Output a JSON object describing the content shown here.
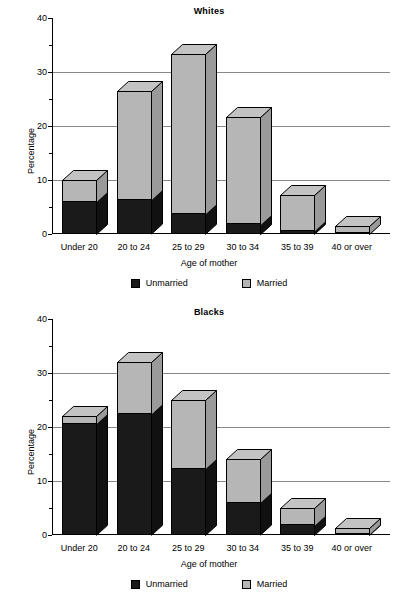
{
  "figure": {
    "axis_y_label": "Percentage",
    "axis_x_label": "Age of mother",
    "legend": {
      "unmarried_label": "Unmarried",
      "married_label": "Married",
      "unmarried_color": "#1a1a1a",
      "married_color": "#b6b6b6"
    }
  },
  "chart_data": [
    {
      "type": "bar",
      "subtype": "stacked-3d-column",
      "title": "Whites",
      "xlabel": "Age of mother",
      "ylabel": "Percentage",
      "categories": [
        "Under 20",
        "20 to 24",
        "25 to 29",
        "30 to 34",
        "35 to 39",
        "40 or over"
      ],
      "series": [
        {
          "name": "Unmarried",
          "color": "#1a1a1a",
          "values": [
            6,
            6.3,
            3.7,
            1.8,
            0.6,
            0.1
          ]
        },
        {
          "name": "Married",
          "color": "#b6b6b6",
          "values": [
            4,
            20.1,
            29.6,
            19.9,
            6.6,
            1.4
          ]
        }
      ],
      "totals": [
        10,
        26.4,
        33.3,
        21.7,
        7.2,
        1.5
      ],
      "ylim": [
        0,
        40
      ],
      "yticks": [
        0,
        10,
        20,
        30,
        40
      ],
      "yticks_minor": [
        5,
        15,
        25,
        35
      ],
      "ytick_labels": [
        "0",
        "10",
        "20",
        "30",
        "40"
      ],
      "grid": "horizontal",
      "legend_position": "bottom"
    },
    {
      "type": "bar",
      "subtype": "stacked-3d-column",
      "title": "Blacks",
      "xlabel": "Age of mother",
      "ylabel": "Percentage",
      "categories": [
        "Under 20",
        "20 to 24",
        "25 to 29",
        "30 to 34",
        "35 to 39",
        "40 or over"
      ],
      "series": [
        {
          "name": "Unmarried",
          "color": "#1a1a1a",
          "values": [
            20.6,
            22.4,
            12.3,
            6.0,
            1.8,
            0.2
          ]
        },
        {
          "name": "Married",
          "color": "#b6b6b6",
          "values": [
            1.4,
            9.6,
            12.7,
            8.0,
            3.2,
            1.1
          ]
        }
      ],
      "totals": [
        22,
        32,
        25,
        14,
        5,
        1.3
      ],
      "ylim": [
        0,
        40
      ],
      "yticks": [
        0,
        10,
        20,
        30,
        40
      ],
      "yticks_minor": [
        5,
        15,
        25,
        35
      ],
      "ytick_labels": [
        "0",
        "10",
        "20",
        "30",
        "40"
      ],
      "grid": "horizontal",
      "legend_position": "bottom"
    }
  ]
}
